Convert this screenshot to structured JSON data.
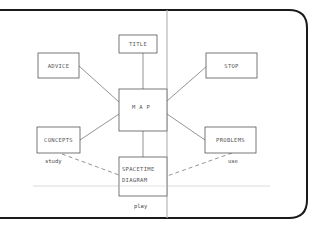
{
  "diagram": {
    "title": "",
    "nodes": [
      {
        "id": "title",
        "lines": [
          "TITLE"
        ]
      },
      {
        "id": "advice",
        "lines": [
          "ADVICE"
        ]
      },
      {
        "id": "stop",
        "lines": [
          "STOP"
        ]
      },
      {
        "id": "map",
        "lines": [
          "M A P"
        ]
      },
      {
        "id": "concepts",
        "lines": [
          "CONCEPTS"
        ]
      },
      {
        "id": "problems",
        "lines": [
          "PROBLEMS"
        ]
      },
      {
        "id": "spacetime",
        "lines": [
          "SPACETIME",
          "DIAGRAM"
        ]
      }
    ],
    "edges": [
      {
        "from": "title",
        "to": "map",
        "style": "solid",
        "label": ""
      },
      {
        "from": "advice",
        "to": "map",
        "style": "solid",
        "label": ""
      },
      {
        "from": "stop",
        "to": "map",
        "style": "solid",
        "label": ""
      },
      {
        "from": "concepts",
        "to": "map",
        "style": "solid",
        "label": ""
      },
      {
        "from": "problems",
        "to": "map",
        "style": "solid",
        "label": ""
      },
      {
        "from": "map",
        "to": "spacetime",
        "style": "solid",
        "label": ""
      },
      {
        "from": "concepts",
        "to": "spacetime",
        "style": "dashed",
        "label": "study"
      },
      {
        "from": "problems",
        "to": "spacetime",
        "style": "dashed",
        "label": "use"
      }
    ],
    "annotations": {
      "study": "study",
      "use": "use",
      "play": "play"
    },
    "colors": {
      "frame": "#1a1a1a",
      "box_stroke": "#555555",
      "line": "#666666",
      "guide": "#c8c8c8",
      "text": "#555555"
    }
  }
}
